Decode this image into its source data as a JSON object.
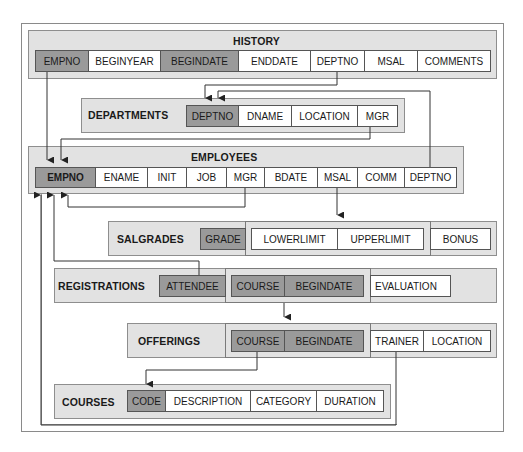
{
  "diagram": {
    "type": "relational-schema",
    "tables": {
      "history": {
        "name": "HISTORY",
        "columns": [
          "EMPNO",
          "BEGINYEAR",
          "BEGINDATE",
          "ENDDATE",
          "DEPTNO",
          "MSAL",
          "COMMENTS"
        ],
        "primary_key": [
          "EMPNO",
          "BEGINDATE"
        ]
      },
      "departments": {
        "name": "DEPARTMENTS",
        "columns": [
          "DEPTNO",
          "DNAME",
          "LOCATION",
          "MGR"
        ],
        "primary_key": [
          "DEPTNO"
        ]
      },
      "employees": {
        "name": "EMPLOYEES",
        "columns": [
          "EMPNO",
          "ENAME",
          "INIT",
          "JOB",
          "MGR",
          "BDATE",
          "MSAL",
          "COMM",
          "DEPTNO"
        ],
        "primary_key": [
          "EMPNO"
        ]
      },
      "salgrades": {
        "name": "SALGRADES",
        "columns": [
          "GRADE",
          "LOWERLIMIT",
          "UPPERLIMIT",
          "BONUS"
        ],
        "primary_key": [
          "GRADE"
        ],
        "grouped": [
          "LOWERLIMIT",
          "UPPERLIMIT"
        ]
      },
      "registrations": {
        "name": "REGISTRATIONS",
        "columns": [
          "ATTENDEE",
          "COURSE",
          "BEGINDATE",
          "EVALUATION"
        ],
        "primary_key": [
          "ATTENDEE",
          "COURSE",
          "BEGINDATE"
        ]
      },
      "offerings": {
        "name": "OFFERINGS",
        "columns": [
          "COURSE",
          "BEGINDATE",
          "TRAINER",
          "LOCATION"
        ],
        "primary_key": [
          "COURSE",
          "BEGINDATE"
        ]
      },
      "courses": {
        "name": "COURSES",
        "columns": [
          "CODE",
          "DESCRIPTION",
          "CATEGORY",
          "DURATION"
        ],
        "primary_key": [
          "CODE"
        ]
      }
    },
    "relationships": [
      {
        "from": "HISTORY.EMPNO",
        "to": "EMPLOYEES.EMPNO"
      },
      {
        "from": "HISTORY.DEPTNO",
        "to": "DEPARTMENTS.DEPTNO"
      },
      {
        "from": "EMPLOYEES.DEPTNO",
        "to": "DEPARTMENTS.DEPTNO"
      },
      {
        "from": "DEPARTMENTS.MGR",
        "to": "EMPLOYEES.EMPNO"
      },
      {
        "from": "EMPLOYEES.MGR",
        "to": "EMPLOYEES.EMPNO"
      },
      {
        "from": "EMPLOYEES.MSAL",
        "to": "SALGRADES.LOWERLIMIT-UPPERLIMIT"
      },
      {
        "from": "REGISTRATIONS.ATTENDEE",
        "to": "EMPLOYEES.EMPNO"
      },
      {
        "from": "REGISTRATIONS.COURSE+BEGINDATE",
        "to": "OFFERINGS.COURSE+BEGINDATE"
      },
      {
        "from": "OFFERINGS.COURSE",
        "to": "COURSES.CODE"
      },
      {
        "from": "OFFERINGS.TRAINER",
        "to": "EMPLOYEES.EMPNO"
      }
    ],
    "colors": {
      "table_background": "#e2e2e2",
      "key_cell": "#9a9a9a",
      "cell": "#ffffff",
      "line": "#333333"
    }
  }
}
